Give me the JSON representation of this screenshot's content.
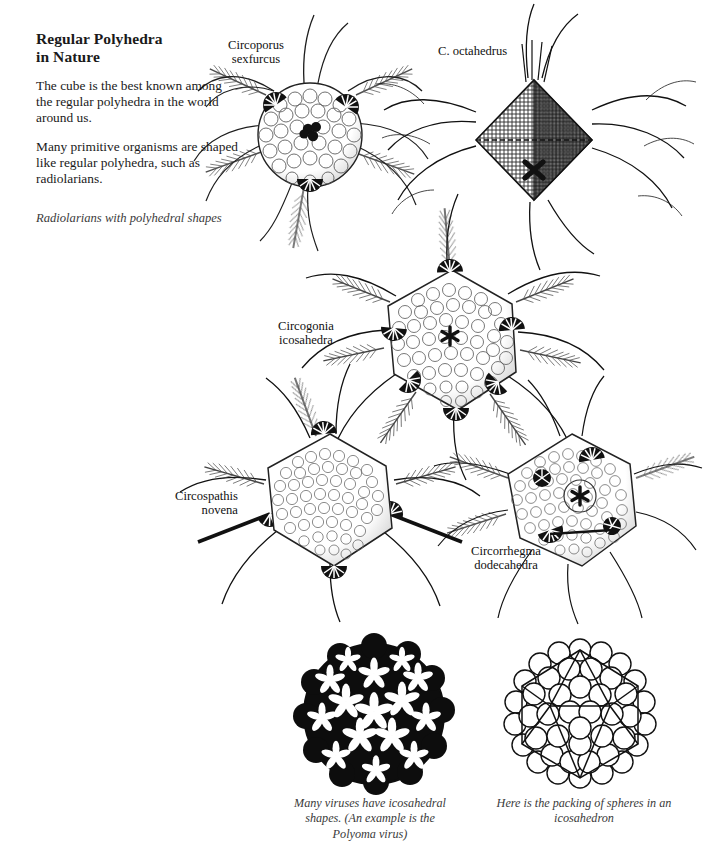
{
  "page": {
    "title": "Regular Polyhedra\nin Nature",
    "title_line1": "Regular Polyhedra",
    "title_line2": "in Nature",
    "background_color": "#ffffff",
    "ink_color": "#111111"
  },
  "intro": {
    "paragraph_1": "The cube is the best known among the regular polyhedra in the world around us.",
    "paragraph_2": "Many primitive organisms are shaped like regular polyhedra, such as radiolarians.",
    "figure_caption": "Radiolarians with polyhedral shapes"
  },
  "specimens": [
    {
      "id": "circoporus",
      "line1": "Circoporus",
      "line2": "sexfurcus",
      "shape": "spherical-lattice"
    },
    {
      "id": "octahedrus",
      "line1": "C. octahedrus",
      "line2": "",
      "shape": "octahedron"
    },
    {
      "id": "circogonia",
      "line1": "Circogonia",
      "line2": "icosahedra",
      "shape": "icosahedron"
    },
    {
      "id": "circospathis",
      "line1": "Circospathis",
      "line2": "novena",
      "shape": "polyhedral-shell"
    },
    {
      "id": "circorrhegma",
      "line1": "Circorrhegma",
      "line2": "dodecahedra",
      "shape": "dodecahedron"
    }
  ],
  "bottom_figures": {
    "virus": {
      "caption_line1": "Many viruses have icosahedral",
      "caption_line2": "shapes. (An example is the",
      "caption_line3": "Polyoma virus)"
    },
    "packing": {
      "caption_line1": "Here is the packing of spheres in an",
      "caption_line2": "icosahedron"
    }
  }
}
